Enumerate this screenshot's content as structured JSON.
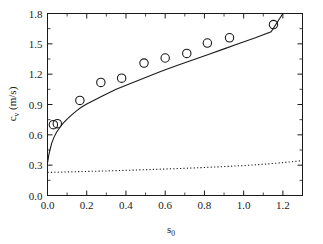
{
  "chart_data": {
    "type": "scatter",
    "title": "",
    "xlabel": "s0",
    "xlabel_base": "s",
    "xlabel_sub": "0",
    "ylabel": "c_v (m/s)",
    "ylabel_base": "c",
    "ylabel_sub": "v",
    "ylabel_unit": " (m/s)",
    "xlim": [
      0.0,
      1.3
    ],
    "ylim": [
      0.0,
      1.8
    ],
    "xticks": [
      0.0,
      0.2,
      0.4,
      0.6,
      0.8,
      1.0,
      1.2
    ],
    "xticklabels": [
      "0.0",
      "0.2",
      "0.4",
      "0.6",
      "0.8",
      "1.0",
      "1.2"
    ],
    "yticks": [
      0.0,
      0.3,
      0.6,
      0.9,
      1.2,
      1.5,
      1.8
    ],
    "yticklabels": [
      "0.0",
      "0.3",
      "0.6",
      "0.9",
      "1.2",
      "1.5",
      "1.8"
    ],
    "xminor_step": 0.1,
    "yminor_step": 0.15,
    "grid": false,
    "legend": "none",
    "ticks_direction": "in",
    "frame": "box",
    "color": "#1a1a1a",
    "series": [
      {
        "name": "measured data",
        "style": "open-circle-markers",
        "marker": "o",
        "marker_size": 5.2,
        "x": [
          0.03,
          0.05,
          0.165,
          0.272,
          0.378,
          0.492,
          0.6,
          0.71,
          0.815,
          0.928,
          1.152
        ],
        "y": [
          0.7,
          0.71,
          0.94,
          1.118,
          1.16,
          1.31,
          1.36,
          1.405,
          1.508,
          1.56,
          1.69
        ]
      },
      {
        "name": "model curve",
        "style": "solid-line",
        "x": [
          0.0,
          0.006,
          0.013,
          0.022,
          0.033,
          0.046,
          0.062,
          0.08,
          0.1,
          0.122,
          0.146,
          0.172,
          0.2,
          0.24,
          0.29,
          0.35,
          0.42,
          0.5,
          0.58,
          0.66,
          0.74,
          0.82,
          0.9,
          0.98,
          1.06,
          1.14,
          1.2
        ],
        "y": [
          0.32,
          0.395,
          0.455,
          0.52,
          0.575,
          0.625,
          0.67,
          0.715,
          0.755,
          0.795,
          0.835,
          0.872,
          0.905,
          0.945,
          0.995,
          1.05,
          1.105,
          1.168,
          1.228,
          1.285,
          1.34,
          1.395,
          1.45,
          1.505,
          1.56,
          1.62,
          1.8
        ]
      },
      {
        "name": "reference curve",
        "style": "dotted-line",
        "x": [
          0.0,
          0.1,
          0.2,
          0.3,
          0.4,
          0.5,
          0.6,
          0.7,
          0.8,
          0.9,
          1.0,
          1.1,
          1.2,
          1.3
        ],
        "y": [
          0.228,
          0.233,
          0.238,
          0.243,
          0.249,
          0.255,
          0.262,
          0.269,
          0.277,
          0.286,
          0.296,
          0.309,
          0.325,
          0.345
        ]
      }
    ]
  }
}
